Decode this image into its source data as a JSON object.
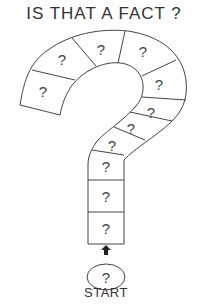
{
  "title": "IS THAT A FACT ?",
  "board": {
    "cell_symbol": "?",
    "cell_count": 12,
    "start_label": "START",
    "start_symbol": "?",
    "line_color": "#444444",
    "background": "#ffffff"
  }
}
